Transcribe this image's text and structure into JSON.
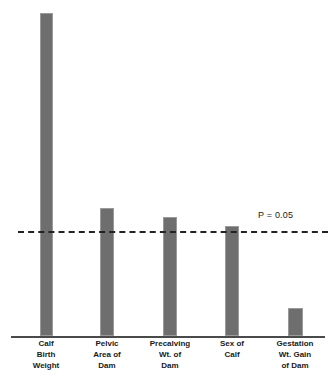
{
  "chart_data": {
    "type": "bar",
    "title": "",
    "subtitle": "",
    "xlabel": "",
    "ylabel": "",
    "grid": false,
    "legend": false,
    "orientation": "vertical",
    "categories": [
      "Calf Birth Weight",
      "Pelvic Area of Dam",
      "Precalving Wt. of Dam",
      "Sex of Calf",
      "Gestation Wt. Gain of Dam"
    ],
    "category_lines": [
      [
        "Calf",
        "Birth",
        "Weight"
      ],
      [
        "Pelvic",
        "Area of",
        "Dam"
      ],
      [
        "Precalving",
        "Wt. of",
        "Dam"
      ],
      [
        "Sex of",
        "Calf"
      ],
      [
        "Gestation",
        "Wt. Gain",
        "of Dam"
      ]
    ],
    "values": [
      100,
      39.6,
      36.6,
      34.0,
      8.7
    ],
    "value_unit": "relative significance (axis unlabeled)",
    "ylim": [
      0,
      100
    ],
    "bar_color": "#6e6e6e",
    "bar_edge_color": "#9a9a9a",
    "axis_color": "#4a4a4a",
    "annotations": [
      {
        "name": "significance-threshold",
        "label": "P = 0.05",
        "type": "horizontal-dashed-line",
        "value": 32.5,
        "line_color": "#222222",
        "label_color": "#1a1a1a"
      }
    ],
    "bars_above_threshold": [
      "Calf Birth Weight",
      "Pelvic Area of Dam",
      "Precalving Wt. of Dam",
      "Sex of Calf"
    ],
    "bars_below_threshold": [
      "Gestation Wt. Gain of Dam"
    ]
  },
  "bar_geometry": [
    {
      "left": 40,
      "top": 13,
      "width": 13,
      "height": 323
    },
    {
      "left": 100,
      "top": 208,
      "width": 14,
      "height": 128
    },
    {
      "left": 163,
      "top": 217,
      "width": 14,
      "height": 119
    },
    {
      "left": 225,
      "top": 226,
      "width": 14,
      "height": 110
    },
    {
      "left": 288,
      "top": 308,
      "width": 15,
      "height": 28
    }
  ],
  "label_geometry": [
    {
      "left": 10
    },
    {
      "left": 71
    },
    {
      "left": 134
    },
    {
      "left": 196
    },
    {
      "left": 259
    }
  ]
}
